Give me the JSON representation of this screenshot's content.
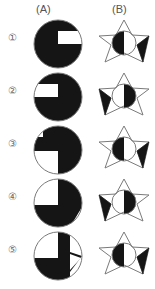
{
  "page": {
    "background": "#ffffff",
    "ink": "#1a1a1a",
    "outline": "#6e6e6e",
    "label_color": "#555555",
    "width": 155,
    "height": 289
  },
  "headers": {
    "column_a": "(A)",
    "column_b": "(B)"
  },
  "rows": [
    {
      "number": "①",
      "a": {
        "shape": "circle",
        "description": "circle with black region covering upper-left, left and lower-left; white square notch in upper-right quadrant interior and white lower-right quadrant",
        "fill_quadrants": [
          "upper-left",
          "lower-left"
        ],
        "notch": "upper-right-bar",
        "white_quadrant": "lower-right"
      },
      "b": {
        "shape": "six-point-star",
        "inner_circle": "half-black-left",
        "filled_point": "right",
        "description": "outlined six-pointed star with inner circle black on left half, solid black right point"
      }
    },
    {
      "number": "②",
      "a": {
        "shape": "circle",
        "description": "circle with black region covering upper-right, right and lower-right; white square notch in upper-left quadrant interior and white lower-left quadrant",
        "fill_quadrants": [
          "upper-right",
          "lower-right"
        ],
        "notch": "upper-left-bar",
        "white_quadrant": "lower-left"
      },
      "b": {
        "shape": "six-point-star",
        "inner_circle": "half-black-right",
        "filled_point": "left",
        "description": "outlined six-pointed star with inner circle black on right half, solid black left point"
      }
    },
    {
      "number": "③",
      "a": {
        "shape": "circle",
        "description": "circle with black right half and black horizontal bar across upper-left; white upper-left corner notch and white lower-left quadrant",
        "fill_quadrants": [
          "upper-right",
          "lower-right"
        ],
        "notch": "upper-left-bar",
        "white_quadrant": "lower-left"
      },
      "b": {
        "shape": "six-point-star",
        "inner_circle": "half-black-left",
        "filled_point": "right",
        "description": "outlined six-pointed star with inner circle black on left half, solid black right point"
      }
    },
    {
      "number": "④",
      "a": {
        "shape": "circle",
        "description": "circle with black right side and black lower-left; white upper-left quadrant and white wedge at lower-right",
        "fill_quadrants": [
          "upper-right",
          "lower-left",
          "lower-right"
        ],
        "notch": "upper-left-square",
        "white_quadrant": "lower-right-wedge"
      },
      "b": {
        "shape": "six-point-star",
        "inner_circle": "half-black-right",
        "filled_point": "left",
        "description": "outlined six-pointed star with inner circle black on right half, solid black left point"
      }
    },
    {
      "number": "⑤",
      "a": {
        "shape": "circle",
        "description": "circle with black vertical bar right of centre and black lower half; white upper-left quadrant and white wedge at right edge",
        "fill_quadrants": [
          "lower-left",
          "lower-right"
        ],
        "notch": "upper-left-square",
        "white_quadrant": "right-wedge"
      },
      "b": {
        "shape": "six-point-star",
        "inner_circle": "half-black-left",
        "filled_point": "right",
        "description": "outlined six-pointed star with inner circle black on left half, solid black right point"
      }
    }
  ]
}
